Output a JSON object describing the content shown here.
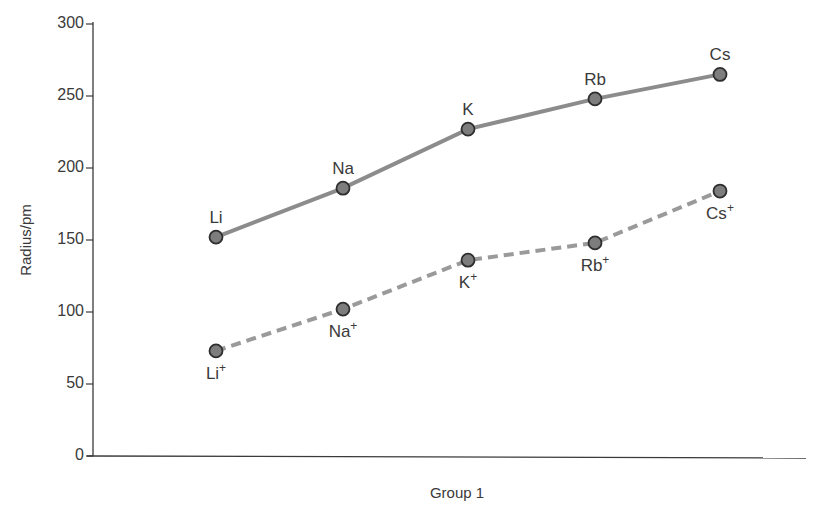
{
  "chart_data": {
    "type": "line",
    "title": "",
    "xlabel": "Group 1",
    "ylabel": "Radius/pm",
    "ylim": [
      0,
      300
    ],
    "yticks": [
      0,
      50,
      100,
      150,
      200,
      250,
      300
    ],
    "grid": false,
    "legend": null,
    "categories": [
      "Li",
      "Na",
      "K",
      "Rb",
      "Cs"
    ],
    "series": [
      {
        "name": "Atomic radius",
        "style": "solid",
        "color": "#8c8c8c",
        "labels": [
          "Li",
          "Na",
          "K",
          "Rb",
          "Cs"
        ],
        "values": [
          152,
          186,
          227,
          248,
          265
        ]
      },
      {
        "name": "Ionic radius",
        "style": "dashed",
        "color": "#9a9a9a",
        "labels": [
          "Li+",
          "Na+",
          "K+",
          "Rb+",
          "Cs+"
        ],
        "values": [
          73,
          102,
          136,
          148,
          184
        ]
      }
    ]
  },
  "axes": {
    "xlabel": "Group 1",
    "ylabel": "Radius/pm",
    "yticks": [
      "0",
      "50",
      "100",
      "150",
      "200",
      "250",
      "300"
    ]
  },
  "colors": {
    "marker_fill": "#7d7d7d",
    "marker_stroke": "#2e2e2e",
    "axis": "#3a3a3a",
    "text": "#3a3a3a"
  }
}
